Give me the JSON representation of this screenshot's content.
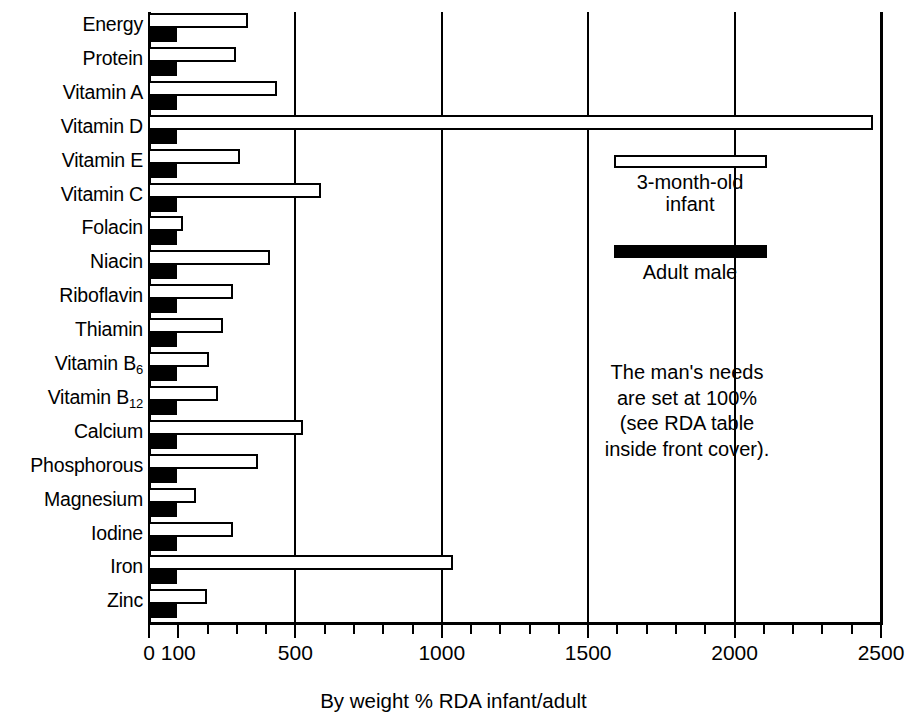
{
  "chart_data": {
    "type": "bar",
    "title": "",
    "xlabel": "By weight % RDA infant/adult",
    "ylabel": "",
    "orientation": "horizontal",
    "xlim": [
      0,
      2500
    ],
    "xticks_labeled": [
      0,
      100,
      500,
      1000,
      1500,
      2000,
      2500
    ],
    "xtick_labels": [
      "0",
      "100",
      "500",
      "1000",
      "1500",
      "2000",
      "2500"
    ],
    "xtick_minor_step": 100,
    "grid": "vertical gridlines at 500, 1000, 1500, 2000",
    "legend_position": "inside upper right",
    "categories": [
      "Energy",
      "Protein",
      "Vitamin A",
      "Vitamin D",
      "Vitamin E",
      "Vitamin C",
      "Folacin",
      "Niacin",
      "Riboflavin",
      "Thiamin",
      "Vitamin B6",
      "Vitamin B12",
      "Calcium",
      "Phosphorous",
      "Magnesium",
      "Iodine",
      "Iron",
      "Zinc"
    ],
    "category_labels_html": [
      "Energy",
      "Protein",
      "Vitamin A",
      "Vitamin D",
      "Vitamin E",
      "Vitamin C",
      "Folacin",
      "Niacin",
      "Riboflavin",
      "Thiamin",
      "Vitamin B<sub>6</sub>",
      "Vitamin B<sub>12</sub>",
      "Calcium",
      "Phosphorous",
      "Magnesium",
      "Iodine",
      "Iron",
      "Zinc"
    ],
    "series": [
      {
        "name": "3-month-old infant",
        "style": "white bar with black outline",
        "values": [
          340,
          300,
          440,
          2475,
          315,
          590,
          120,
          415,
          290,
          255,
          210,
          240,
          530,
          375,
          165,
          290,
          1040,
          200
        ]
      },
      {
        "name": "Adult male",
        "style": "solid black bar",
        "values": [
          100,
          100,
          100,
          100,
          100,
          100,
          100,
          100,
          100,
          100,
          100,
          100,
          100,
          100,
          100,
          100,
          100,
          100
        ]
      }
    ]
  },
  "legend": {
    "infant": {
      "line1": "3-month-old",
      "line2": "infant"
    },
    "adult": {
      "line1": "Adult male"
    }
  },
  "note": {
    "line1": "The man's needs",
    "line2": "are set at 100%",
    "line3": "(see RDA table",
    "line4": "inside front cover)."
  },
  "colors": {
    "ink": "#000000",
    "paper": "#ffffff",
    "infant_fill": "#ffffff",
    "adult_fill": "#000000"
  }
}
